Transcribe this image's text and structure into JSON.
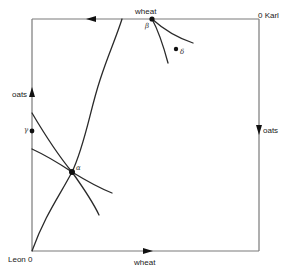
{
  "diagram": {
    "type": "edgeworth-box",
    "axes": {
      "leon_origin_label": "Leon 0",
      "karl_origin_label": "0 Karl",
      "top_axis_label": "wheat",
      "bottom_axis_label": "wheat",
      "left_axis_label": "oats",
      "right_axis_label": "oats"
    },
    "points": {
      "alpha": "α",
      "beta": "β",
      "gamma": "γ",
      "delta": "δ"
    },
    "colors": {
      "frame": "#7a7a7a",
      "curve": "#2a2a2a",
      "text": "#222222"
    }
  }
}
